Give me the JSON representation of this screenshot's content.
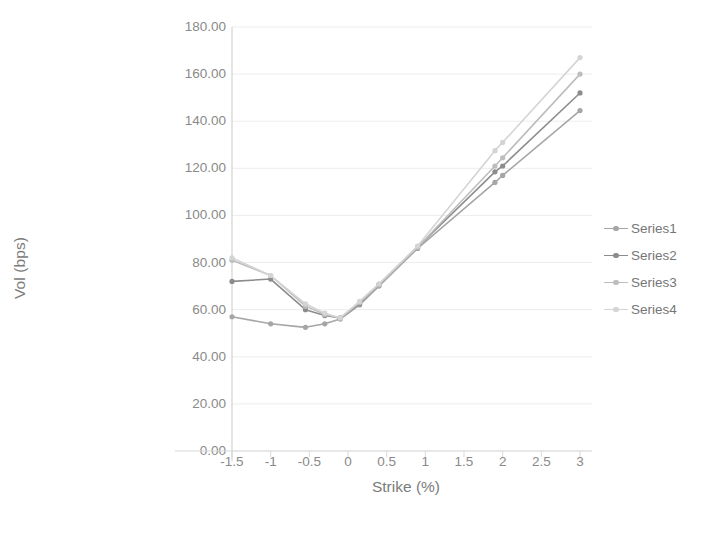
{
  "chart_data": {
    "type": "line",
    "title": "",
    "xlabel": "Strike (%)",
    "ylabel": "Vol (bps)",
    "xlim": [
      -1.5,
      3
    ],
    "ylim": [
      0,
      180
    ],
    "xticks": [
      "-1.5",
      "-1",
      "-0.5",
      "0",
      "0.5",
      "1",
      "1.5",
      "2",
      "2.5",
      "3"
    ],
    "xtick_values": [
      -1.5,
      -1,
      -0.5,
      0,
      0.5,
      1,
      1.5,
      2,
      2.5,
      3
    ],
    "yticks": [
      "0.00",
      "20.00",
      "40.00",
      "60.00",
      "80.00",
      "100.00",
      "120.00",
      "140.00",
      "160.00",
      "180.00"
    ],
    "ytick_values": [
      0,
      20,
      40,
      60,
      80,
      100,
      120,
      140,
      160,
      180
    ],
    "grid": true,
    "grid_axis": "y",
    "legend_position": "right",
    "markers": true,
    "series": [
      {
        "name": "Series1",
        "color": "#a6a6a6",
        "x": [
          -1.5,
          -1.0,
          -0.55,
          -0.3,
          -0.1,
          0.15,
          0.4,
          0.9,
          1.9,
          2.0,
          3.0
        ],
        "y": [
          57.0,
          54.0,
          52.5,
          54.0,
          56.0,
          62.0,
          70.0,
          86.0,
          114.0,
          117.0,
          144.5
        ]
      },
      {
        "name": "Series2",
        "color": "#8c8c8c",
        "x": [
          -1.5,
          -1.0,
          -0.55,
          -0.3,
          -0.1,
          0.15,
          0.4,
          0.9,
          1.9,
          2.0,
          3.0
        ],
        "y": [
          72.0,
          73.0,
          60.0,
          57.5,
          56.5,
          62.5,
          70.5,
          86.5,
          118.5,
          121.0,
          152.0
        ]
      },
      {
        "name": "Series3",
        "color": "#bdbdbd",
        "x": [
          -1.5,
          -1.0,
          -0.55,
          -0.3,
          -0.1,
          0.15,
          0.4,
          0.9,
          1.9,
          2.0,
          3.0
        ],
        "y": [
          81.0,
          74.5,
          61.5,
          58.0,
          56.5,
          63.0,
          70.5,
          86.5,
          121.0,
          124.5,
          160.0
        ]
      },
      {
        "name": "Series4",
        "color": "#d4d4d4",
        "x": [
          -1.5,
          -1.0,
          -0.55,
          -0.3,
          -0.1,
          0.15,
          0.4,
          0.9,
          1.9,
          2.0,
          3.0
        ],
        "y": [
          82.0,
          74.5,
          62.5,
          58.5,
          56.5,
          63.5,
          71.0,
          87.0,
          127.5,
          131.0,
          167.0
        ]
      }
    ]
  },
  "legend": {
    "items": [
      {
        "label": "Series1"
      },
      {
        "label": "Series2"
      },
      {
        "label": "Series3"
      },
      {
        "label": "Series4"
      }
    ]
  },
  "axes": {
    "colors": {
      "axis_line": "#d9d9d9",
      "grid_line": "#ededed",
      "tick_text": "#8a8a8a",
      "title_text": "#7b7b7b"
    }
  }
}
